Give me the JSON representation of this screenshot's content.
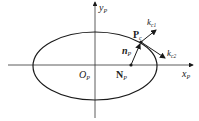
{
  "diagram": {
    "axes": {
      "x_label": "x",
      "x_sub": "P",
      "y_label": "y",
      "y_sub": "P"
    },
    "origin": {
      "label": "O",
      "sub": "P"
    },
    "point_P": {
      "label": "P",
      "sub": "c"
    },
    "point_N": {
      "label": "N",
      "sub": "P"
    },
    "normal": {
      "label": "n",
      "sub": "P"
    },
    "vector_k1": {
      "label": "k",
      "sub": "c1"
    },
    "vector_k2": {
      "label": "k",
      "sub": "c2"
    },
    "colors": {
      "stroke": "#1a1a1a",
      "axis": "#333333",
      "background": "#ffffff"
    }
  }
}
